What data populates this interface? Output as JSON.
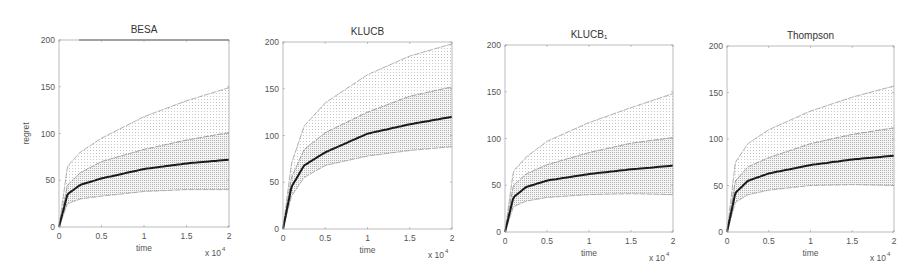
{
  "chart_data": [
    {
      "type": "line",
      "title": "BESA",
      "xlabel": "time",
      "ylabel": "regret",
      "x_multiplier": "x 10^4",
      "xlim": [
        0,
        2
      ],
      "ylim": [
        0,
        200
      ],
      "xticks": [
        "0",
        "0.5",
        "1",
        "1.5",
        "2"
      ],
      "yticks": [
        "0",
        "50",
        "100",
        "150",
        "200"
      ],
      "x": [
        0,
        0.1,
        0.25,
        0.5,
        1,
        1.5,
        2
      ],
      "series": [
        {
          "name": "mean",
          "values": [
            0,
            35,
            45,
            52,
            62,
            68,
            72
          ]
        },
        {
          "name": "inner-upper",
          "values": [
            0,
            45,
            58,
            70,
            83,
            93,
            101
          ]
        },
        {
          "name": "lower",
          "values": [
            0,
            25,
            30,
            33,
            38,
            40,
            40
          ]
        },
        {
          "name": "outer-upper",
          "values": [
            0,
            65,
            80,
            95,
            118,
            135,
            149
          ]
        }
      ],
      "grid": false
    },
    {
      "type": "line",
      "title": "KLUCB",
      "xlabel": "time",
      "ylabel": "",
      "x_multiplier": "x 10^4",
      "xlim": [
        0,
        2
      ],
      "ylim": [
        0,
        200
      ],
      "xticks": [
        "0",
        "0.5",
        "1",
        "1.5",
        "2"
      ],
      "yticks": [
        "0",
        "50",
        "100",
        "150",
        "200"
      ],
      "x": [
        0,
        0.1,
        0.25,
        0.5,
        1,
        1.5,
        2
      ],
      "series": [
        {
          "name": "mean",
          "values": [
            0,
            45,
            68,
            82,
            102,
            112,
            120
          ]
        },
        {
          "name": "inner-upper",
          "values": [
            0,
            55,
            85,
            103,
            125,
            142,
            152
          ]
        },
        {
          "name": "lower",
          "values": [
            0,
            35,
            55,
            68,
            78,
            84,
            88
          ]
        },
        {
          "name": "outer-upper",
          "values": [
            0,
            70,
            110,
            135,
            165,
            185,
            198
          ]
        }
      ],
      "grid": false
    },
    {
      "type": "line",
      "title": "KLUCB+",
      "xlabel": "time",
      "ylabel": "",
      "x_multiplier": "x 10^4",
      "xlim": [
        0,
        2
      ],
      "ylim": [
        0,
        200
      ],
      "xticks": [
        "0",
        "0.5",
        "1",
        "1.5",
        "2"
      ],
      "yticks": [
        "0",
        "50",
        "100",
        "150",
        "200"
      ],
      "x": [
        0,
        0.1,
        0.25,
        0.5,
        1,
        1.5,
        2
      ],
      "series": [
        {
          "name": "mean",
          "values": [
            0,
            37,
            48,
            55,
            62,
            67,
            71
          ]
        },
        {
          "name": "inner-upper",
          "values": [
            0,
            50,
            62,
            72,
            85,
            95,
            101
          ]
        },
        {
          "name": "lower",
          "values": [
            0,
            27,
            33,
            37,
            40,
            41,
            40
          ]
        },
        {
          "name": "outer-upper",
          "values": [
            0,
            65,
            80,
            97,
            117,
            133,
            148
          ]
        }
      ],
      "grid": false
    },
    {
      "type": "line",
      "title": "Thompson",
      "xlabel": "time",
      "ylabel": "",
      "x_multiplier": "x 10^4",
      "xlim": [
        0,
        2
      ],
      "ylim": [
        0,
        200
      ],
      "xticks": [
        "0",
        "0.5",
        "1",
        "1.5",
        "2"
      ],
      "yticks": [
        "0",
        "50",
        "100",
        "150",
        "200"
      ],
      "x": [
        0,
        0.1,
        0.25,
        0.5,
        1,
        1.5,
        2
      ],
      "series": [
        {
          "name": "mean",
          "values": [
            0,
            42,
            55,
            63,
            72,
            78,
            82
          ]
        },
        {
          "name": "inner-upper",
          "values": [
            0,
            55,
            70,
            80,
            95,
            105,
            112
          ]
        },
        {
          "name": "lower",
          "values": [
            0,
            32,
            40,
            45,
            50,
            51,
            50
          ]
        },
        {
          "name": "outer-upper",
          "values": [
            0,
            75,
            95,
            110,
            130,
            145,
            157
          ]
        }
      ],
      "grid": false
    }
  ],
  "panels": [
    {
      "title": "BESA",
      "ylabel": "regret",
      "xlabel": "time",
      "multiplier": "x 10"
    },
    {
      "title": "KLUCB",
      "ylabel": "",
      "xlabel": "time",
      "multiplier": "x 10"
    },
    {
      "title": "KLUCB₁",
      "ylabel": "",
      "xlabel": "time",
      "multiplier": "x 10"
    },
    {
      "title": "Thompson",
      "ylabel": "",
      "xlabel": "time",
      "multiplier": "x 10"
    }
  ],
  "exponent": "4"
}
